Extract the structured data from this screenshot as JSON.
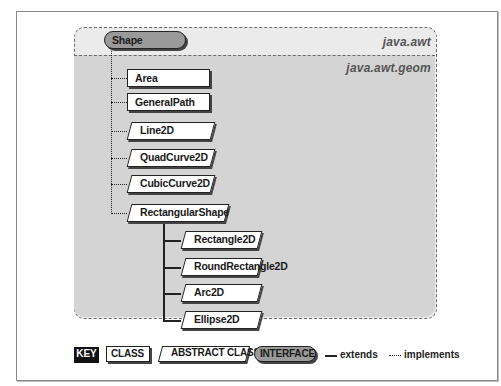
{
  "packages": {
    "outer": "java.awt",
    "inner": "java.awt.geom"
  },
  "nodes": {
    "shape": {
      "label": "Shape",
      "kind": "interface"
    },
    "area": {
      "label": "Area",
      "kind": "class"
    },
    "generalpath": {
      "label": "GeneralPath",
      "kind": "class"
    },
    "line2d": {
      "label": "Line2D",
      "kind": "abstract-class"
    },
    "quadcurve2d": {
      "label": "QuadCurve2D",
      "kind": "abstract-class"
    },
    "cubiccurve2d": {
      "label": "CubicCurve2D",
      "kind": "abstract-class"
    },
    "rectangularshape": {
      "label": "RectangularShape",
      "kind": "abstract-class"
    },
    "rectangle2d": {
      "label": "Rectangle2D",
      "kind": "abstract-class"
    },
    "roundrectangle2d": {
      "label": "RoundRectangle2D",
      "kind": "abstract-class"
    },
    "arc2d": {
      "label": "Arc2D",
      "kind": "abstract-class"
    },
    "ellipse2d": {
      "label": "Ellipse2D",
      "kind": "abstract-class"
    }
  },
  "relations": [
    {
      "from": "Area",
      "to": "Shape",
      "type": "implements"
    },
    {
      "from": "GeneralPath",
      "to": "Shape",
      "type": "implements"
    },
    {
      "from": "Line2D",
      "to": "Shape",
      "type": "implements"
    },
    {
      "from": "QuadCurve2D",
      "to": "Shape",
      "type": "implements"
    },
    {
      "from": "CubicCurve2D",
      "to": "Shape",
      "type": "implements"
    },
    {
      "from": "RectangularShape",
      "to": "Shape",
      "type": "implements"
    },
    {
      "from": "Rectangle2D",
      "to": "RectangularShape",
      "type": "extends"
    },
    {
      "from": "RoundRectangle2D",
      "to": "RectangularShape",
      "type": "extends"
    },
    {
      "from": "Arc2D",
      "to": "RectangularShape",
      "type": "extends"
    },
    {
      "from": "Ellipse2D",
      "to": "RectangularShape",
      "type": "extends"
    }
  ],
  "legend": {
    "key": "KEY",
    "class": "CLASS",
    "abstract_class": "ABSTRACT CLASS",
    "interface": "INTERFACE",
    "extends": "extends",
    "implements": "implements"
  }
}
